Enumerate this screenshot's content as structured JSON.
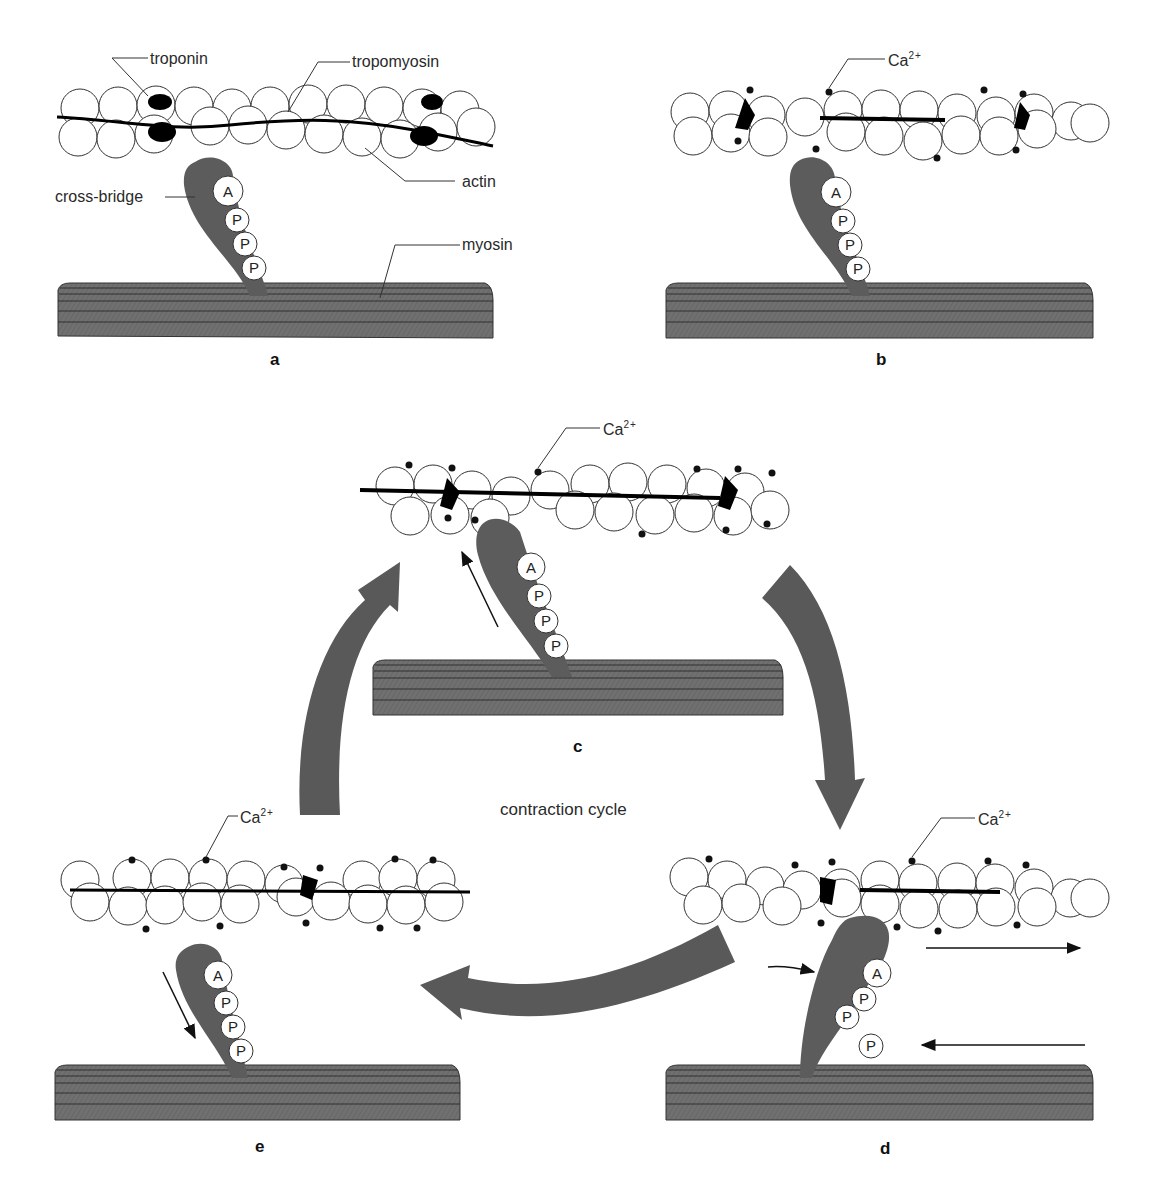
{
  "figure": {
    "title": "contraction cycle",
    "colors": {
      "myosin_fill": "#6e6e6e",
      "cross_bridge_fill": "#5c5c5c",
      "cycle_arrow_fill": "#595959",
      "actin_fill": "#ffffff",
      "troponin_fill": "#000000",
      "calcium_dot": "#111111"
    },
    "molecule_labels": {
      "adenosine": "A",
      "phosphate": "P"
    },
    "panels": [
      {
        "id": "a",
        "letter": "a",
        "labels": {
          "troponin": "troponin",
          "tropomyosin": "tropomyosin",
          "actin": "actin",
          "cross_bridge": "cross-bridge",
          "myosin": "myosin"
        }
      },
      {
        "id": "b",
        "letter": "b",
        "labels": {
          "calcium": "Ca",
          "calcium_charge": "2+"
        }
      },
      {
        "id": "c",
        "letter": "c",
        "labels": {
          "calcium": "Ca",
          "calcium_charge": "2+"
        }
      },
      {
        "id": "d",
        "letter": "d",
        "labels": {
          "calcium": "Ca",
          "calcium_charge": "2+"
        }
      },
      {
        "id": "e",
        "letter": "e",
        "labels": {
          "calcium": "Ca",
          "calcium_charge": "2+"
        }
      }
    ],
    "cycle_order": [
      "c",
      "d",
      "e",
      "c"
    ]
  }
}
